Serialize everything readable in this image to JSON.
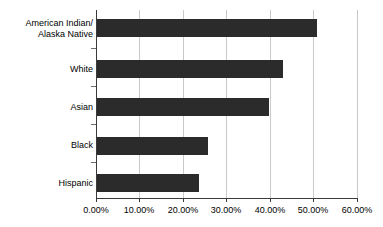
{
  "chart_data": {
    "type": "bar",
    "orientation": "horizontal",
    "title": "",
    "subtitle": "",
    "xlabel": "",
    "ylabel": "",
    "categories": [
      "American Indian/\nAlaska Native",
      "White",
      "Asian",
      "Black",
      "Hispanic"
    ],
    "values": [
      50.7,
      43.1,
      39.8,
      25.8,
      23.7
    ],
    "value_labels": [
      "50.70%",
      "43.10%",
      "39.80%",
      "25.80%",
      "23.70%"
    ],
    "xlim": [
      0,
      60
    ],
    "ylim": [
      0,
      5
    ],
    "x_tick_values": [
      0,
      10,
      20,
      30,
      40,
      50,
      60
    ],
    "x_tick_labels": [
      "0.00%",
      "10.00%",
      "20.00%",
      "30.00%",
      "40.00%",
      "50.00%",
      "60.00%"
    ],
    "grid": "vertical",
    "legend": "none",
    "bar_color": "#2b2b2b",
    "gridline_color": "#c9c9c9",
    "axis_color": "#3a3a3a",
    "background_color": "#ffffff"
  }
}
